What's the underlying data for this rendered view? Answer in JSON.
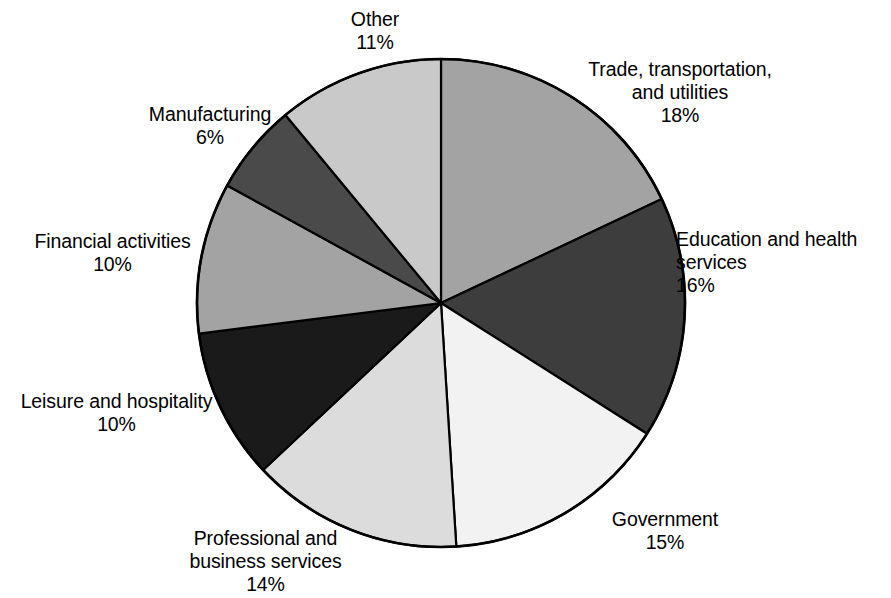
{
  "chart_data": {
    "type": "pie",
    "title": "",
    "subtitle": "",
    "xlabel": "",
    "ylabel": "",
    "legend_position": "none",
    "grid": false,
    "start_angle_deg": 0,
    "direction": "clockwise",
    "value_unit": "percent",
    "categories": [
      "Trade, transportation,\nand utilities",
      "Education and health\nservices",
      "Government",
      "Professional and\nbusiness services",
      "Leisure and hospitality",
      "Financial activities",
      "Manufacturing",
      "Other"
    ],
    "values": [
      18,
      16,
      15,
      14,
      10,
      10,
      6,
      11
    ],
    "value_labels": [
      "18%",
      "16%",
      "15%",
      "14%",
      "10%",
      "10%",
      "6%",
      "11%"
    ],
    "colors": [
      "#a3a3a3",
      "#3d3d3d",
      "#f2f2f2",
      "#dcdcdc",
      "#1a1a1a",
      "#a3a3a3",
      "#4a4a4a",
      "#c9c9c9"
    ],
    "slices": [
      {
        "name": "trade",
        "label": "Trade, transportation,\nand utilities",
        "value": 18,
        "value_label": "18%",
        "color": "#a3a3a3"
      },
      {
        "name": "education",
        "label": "Education and health\nservices",
        "value": 16,
        "value_label": "16%",
        "color": "#3d3d3d"
      },
      {
        "name": "government",
        "label": "Government",
        "value": 15,
        "value_label": "15%",
        "color": "#f2f2f2"
      },
      {
        "name": "professional",
        "label": "Professional and\nbusiness services",
        "value": 14,
        "value_label": "14%",
        "color": "#dcdcdc"
      },
      {
        "name": "leisure",
        "label": "Leisure and hospitality",
        "value": 10,
        "value_label": "10%",
        "color": "#1a1a1a"
      },
      {
        "name": "financial",
        "label": "Financial activities",
        "value": 10,
        "value_label": "10%",
        "color": "#a3a3a3"
      },
      {
        "name": "manufacturing",
        "label": "Manufacturing",
        "value": 6,
        "value_label": "6%",
        "color": "#4a4a4a"
      },
      {
        "name": "other",
        "label": "Other",
        "value": 11,
        "value_label": "11%",
        "color": "#c9c9c9"
      }
    ]
  },
  "labels": {
    "trade": {
      "text": "Trade, transportation,\nand utilities\n18%"
    },
    "education": {
      "text": "Education and health\nservices\n16%"
    },
    "government": {
      "text": "Government\n15%"
    },
    "professional": {
      "text": "Professional and\nbusiness services\n14%"
    },
    "leisure": {
      "text": "Leisure and hospitality\n10%"
    },
    "financial": {
      "text": "Financial activities\n10%"
    },
    "manufacturing": {
      "text": "Manufacturing\n6%"
    },
    "other": {
      "text": "Other\n11%"
    }
  },
  "style": {
    "outline_color": "#000000",
    "background": "#ffffff"
  }
}
